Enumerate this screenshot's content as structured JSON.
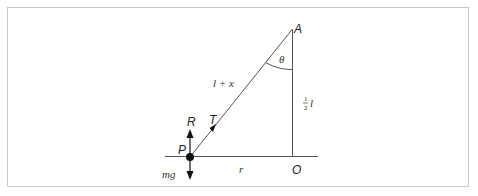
{
  "diagram": {
    "labels": {
      "A": "A",
      "O": "O",
      "P": "P",
      "R": "R",
      "T": "T",
      "theta": "θ",
      "hyp": "l + x",
      "base": "r",
      "mg": "mg",
      "half_num": "1",
      "half_den": "2",
      "half_var": "l"
    },
    "colors": {
      "line": "#555555",
      "frame": "#c8c8c8",
      "particle": "#111111"
    }
  }
}
